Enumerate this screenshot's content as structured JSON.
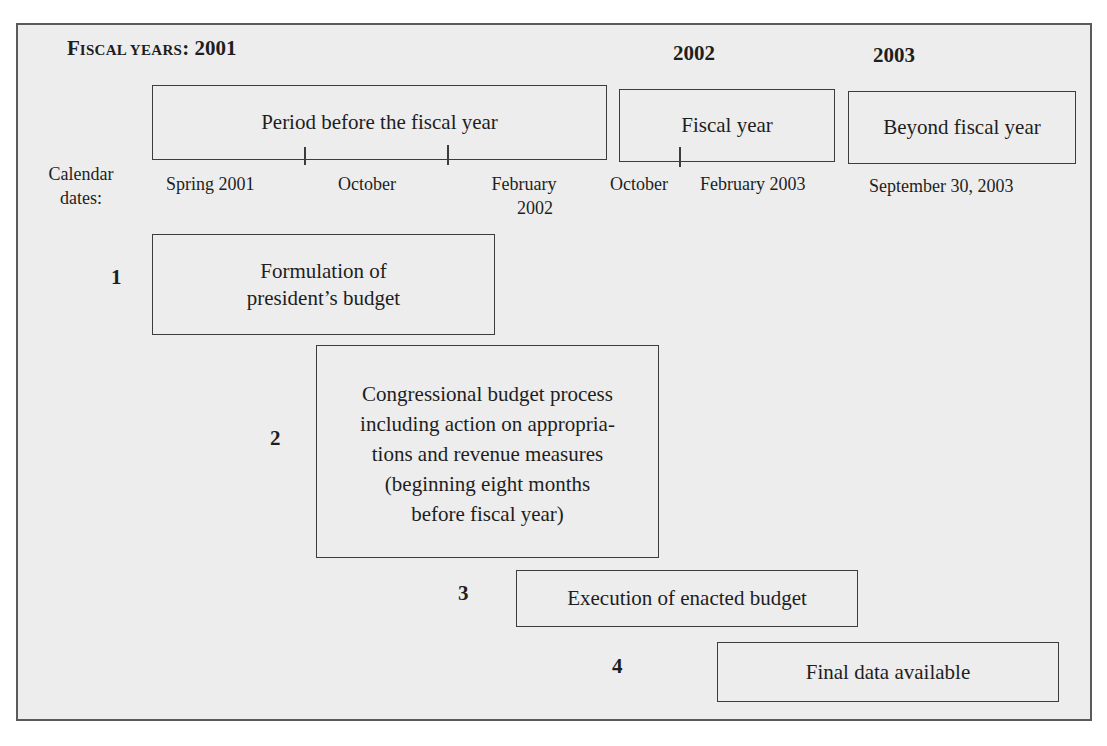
{
  "header": {
    "title_prefix_cap": "F",
    "title_prefix_sc": "ISCAL YEARS",
    "title_suffix": ": 2001",
    "years": [
      "2002",
      "2003"
    ]
  },
  "periods": [
    {
      "label": "Period before the fiscal year"
    },
    {
      "label": "Fiscal year"
    },
    {
      "label": "Beyond fiscal year"
    }
  ],
  "calendar": {
    "label_line1": "Calendar",
    "label_line2": "dates:",
    "dates": [
      {
        "line1": "Spring 2001"
      },
      {
        "line1": "October"
      },
      {
        "line1": "February",
        "line2": "2002"
      },
      {
        "line1": "October"
      },
      {
        "line1": "February 2003"
      },
      {
        "line1": "September 30, 2003"
      }
    ]
  },
  "stages": [
    {
      "number": "1",
      "lines": [
        "Formulation of",
        "president’s budget"
      ]
    },
    {
      "number": "2",
      "lines": [
        "Congressional budget process",
        "including action on appropria-",
        "tions and revenue measures",
        "(beginning eight months",
        "before fiscal year)"
      ]
    },
    {
      "number": "3",
      "lines": [
        "Execution of enacted budget"
      ]
    },
    {
      "number": "4",
      "lines": [
        "Final data available"
      ]
    }
  ]
}
